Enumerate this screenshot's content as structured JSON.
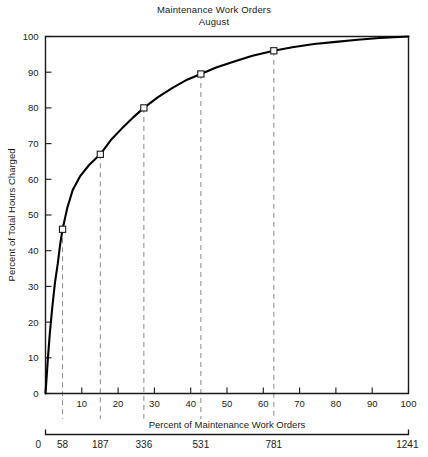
{
  "title": {
    "line1": "Maintenance Work Orders",
    "line2": "August"
  },
  "chart_data": {
    "type": "line",
    "title": "Maintenance Work Orders August",
    "xlabel": "Percent of Maintenance Work Orders",
    "ylabel": "Percent of Total Hours Charged",
    "xlim": [
      0,
      100
    ],
    "ylim": [
      0,
      100
    ],
    "grid": false,
    "legend": null,
    "x_ticks": [
      0,
      10,
      20,
      30,
      40,
      50,
      60,
      70,
      80,
      90,
      100
    ],
    "y_ticks": [
      0,
      10,
      20,
      30,
      40,
      50,
      60,
      70,
      80,
      90,
      100
    ],
    "secondary_xaxis": {
      "label": "Maintenance Work Orders (count)",
      "ticks": [
        0,
        58,
        187,
        336,
        531,
        781,
        1241
      ],
      "tick_positions_percent": [
        0,
        4.7,
        15.1,
        27.1,
        42.8,
        62.9,
        100
      ]
    },
    "markers": {
      "shape": "open-square",
      "points": [
        {
          "x": 4.7,
          "y": 46.0
        },
        {
          "x": 15.1,
          "y": 67.0
        },
        {
          "x": 27.1,
          "y": 80.0
        },
        {
          "x": 42.8,
          "y": 89.5
        },
        {
          "x": 62.9,
          "y": 96.0
        }
      ]
    },
    "curve": [
      {
        "x": 0.0,
        "y": 0.0
      },
      {
        "x": 0.6,
        "y": 9.0
      },
      {
        "x": 1.2,
        "y": 17.0
      },
      {
        "x": 1.9,
        "y": 24.5
      },
      {
        "x": 2.6,
        "y": 31.0
      },
      {
        "x": 3.4,
        "y": 36.5
      },
      {
        "x": 4.0,
        "y": 41.5
      },
      {
        "x": 4.7,
        "y": 46.0
      },
      {
        "x": 6.0,
        "y": 52.0
      },
      {
        "x": 7.5,
        "y": 57.0
      },
      {
        "x": 9.5,
        "y": 60.8
      },
      {
        "x": 12.0,
        "y": 64.0
      },
      {
        "x": 15.1,
        "y": 67.0
      },
      {
        "x": 18.0,
        "y": 71.0
      },
      {
        "x": 21.0,
        "y": 74.2
      },
      {
        "x": 24.0,
        "y": 77.2
      },
      {
        "x": 27.1,
        "y": 80.0
      },
      {
        "x": 31.0,
        "y": 83.0
      },
      {
        "x": 35.0,
        "y": 85.6
      },
      {
        "x": 39.0,
        "y": 87.9
      },
      {
        "x": 42.8,
        "y": 89.5
      },
      {
        "x": 47.0,
        "y": 91.3
      },
      {
        "x": 52.0,
        "y": 93.0
      },
      {
        "x": 57.0,
        "y": 94.6
      },
      {
        "x": 62.9,
        "y": 96.0
      },
      {
        "x": 68.0,
        "y": 97.0
      },
      {
        "x": 74.0,
        "y": 97.9
      },
      {
        "x": 80.0,
        "y": 98.5
      },
      {
        "x": 86.0,
        "y": 99.1
      },
      {
        "x": 92.0,
        "y": 99.6
      },
      {
        "x": 100.0,
        "y": 100.0
      }
    ],
    "dropline_x_percent": [
      4.7,
      15.1,
      27.1,
      42.8,
      62.9
    ],
    "colors": {
      "curve": "#000000",
      "axis": "#1a1a1a",
      "dropline": "#8a8a8a",
      "marker_fill": "#ffffff",
      "marker_stroke": "#1a1a1a"
    }
  }
}
